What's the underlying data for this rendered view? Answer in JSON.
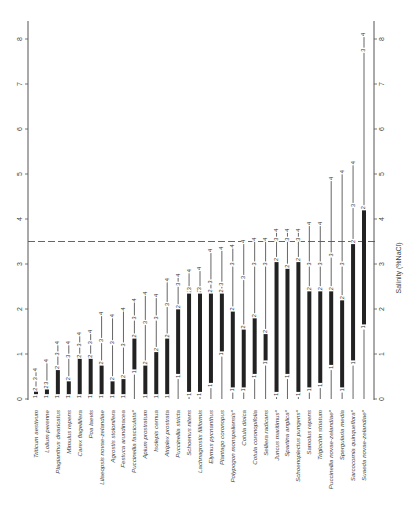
{
  "chart_data": {
    "type": "bar",
    "orientation": "rotated 90° (species labels along bottom, read rotated)",
    "title": "",
    "xlabel": "",
    "ylabel": "Salinity (%NaCl)",
    "ylim": [
      0,
      8
    ],
    "yticks": [
      0,
      1,
      2,
      3,
      4,
      5,
      6,
      7,
      8
    ],
    "reference_line": {
      "value": 3.5,
      "style": "dashed"
    },
    "marker_legend": [
      "1",
      "2",
      "3",
      "4"
    ],
    "categories": [
      "Triticum aestivum",
      "Lolium perenne",
      "Plagianthus divaricatus",
      "Mimulus repens",
      "Carex flagellifera",
      "Poa laevis",
      "Lilaeopsis novae-zelandiae",
      "Agrostis stolonifera",
      "Festuca arundinacea",
      "Puccinellia fasciculata*",
      "Apium prostratum",
      "Isolepis cernua",
      "Atriplex prostrata",
      "Puccinellia stricta",
      "Schoenus nitens",
      "Lachnagrostis filiformis",
      "Elymus pycnanthus",
      "Plantago coronopus",
      "Polypogon monspeliensis*",
      "Cotula dioica",
      "Cotula coronopifolia",
      "Selliera radicans",
      "Juncus maritimus*",
      "Spartina anglica*",
      "Schoenoplectus pungens*",
      "Samolus repens",
      "Triglochin striatum",
      "Puccinellia novae-zelandiae*",
      "Spergularia media",
      "Sarcocornia quinqueflora*",
      "Suaeda novae-zelandiae*"
    ],
    "series": [
      {
        "name": "1 (thick bar start)",
        "values": [
          0,
          0,
          0,
          0,
          0.05,
          0,
          0,
          0,
          0,
          0.6,
          0,
          0,
          0,
          0.5,
          0.1,
          0.1,
          0.3,
          1.0,
          0.2,
          0.2,
          0.5,
          0.8,
          0.1,
          0.5,
          0.1,
          0.2,
          0.3,
          0.7,
          0.2,
          0.8,
          1.6
        ]
      },
      {
        "name": "2",
        "values": [
          0.22,
          0.27,
          0.7,
          0.45,
          0.95,
          0.95,
          0.8,
          0.45,
          0.5,
          1.4,
          0.8,
          1.1,
          1.4,
          2.05,
          2.4,
          2.4,
          2.4,
          2.4,
          2.0,
          1.6,
          1.85,
          1.5,
          3.1,
          2.95,
          3.1,
          2.45,
          2.45,
          2.45,
          2.25,
          3.5,
          4.25
        ]
      },
      {
        "name": "3",
        "values": [
          0.45,
          0.35,
          1.0,
          0.95,
          1.2,
          1.25,
          1.3,
          1.25,
          1.2,
          1.8,
          1.7,
          1.8,
          2.1,
          2.55,
          2.45,
          2.45,
          2.6,
          2.55,
          3.0,
          2.7,
          3.0,
          3.0,
          3.55,
          3.55,
          3.55,
          3.0,
          3.0,
          3.2,
          3.0,
          4.3,
          7.75
        ]
      },
      {
        "name": "4",
        "values": [
          0.65,
          0.85,
          1.25,
          1.25,
          1.45,
          1.5,
          1.9,
          1.85,
          2.0,
          2.2,
          2.35,
          2.3,
          2.65,
          2.75,
          2.85,
          2.9,
          3.3,
          3.35,
          3.4,
          3.5,
          3.55,
          3.55,
          3.75,
          3.75,
          3.75,
          3.9,
          3.9,
          4.9,
          5.05,
          5.25,
          8.1
        ]
      }
    ],
    "grid": false,
    "legend": "none"
  }
}
